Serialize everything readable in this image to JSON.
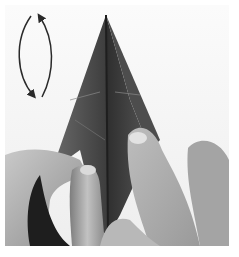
{
  "image": {
    "description": "Grayscale photo of hands folding a dark paper origami model into a pointed kite/diamond shape, with a curved double-headed arrow at top-left indicating a fold/flip motion",
    "colors": {
      "background": "#f4f4f4",
      "paper_dark": "#3a3a3a",
      "paper_mid": "#5a5a5a",
      "skin_light": "#cfcfcf",
      "skin_mid": "#a8a8a8",
      "skin_shadow": "#6e6e6e",
      "arrow": "#2a2a2a"
    },
    "annotation": {
      "type": "curved-double-arrow",
      "meaning": "turn over / flip"
    }
  }
}
